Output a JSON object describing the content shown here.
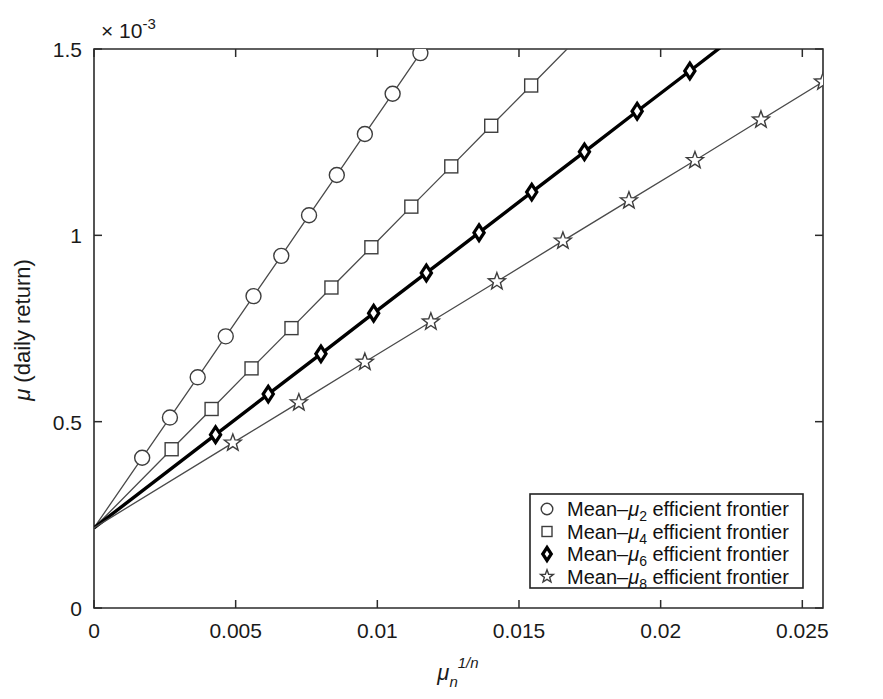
{
  "figure": {
    "background_color": "#ffffff",
    "axis_color": "#2b2b2b",
    "line_color_thin": "#4a4a4a",
    "line_color_thick": "#000000"
  },
  "chart_data": {
    "type": "line",
    "title": "",
    "subtitle": "",
    "xlabel": "μₙ^(1/n)",
    "xlabel_base": "μ",
    "xlabel_sub": "n",
    "xlabel_sup": "1/n",
    "ylabel": "μ (daily return)",
    "ylabel_base": "μ",
    "ylabel_rest": " (daily return)",
    "y_multiplier": "× 10",
    "y_multiplier_exp": "-3",
    "xlim": [
      0,
      0.02573
    ],
    "ylim": [
      0,
      1.5
    ],
    "y_scale_factor": 0.001,
    "xticks": [
      0,
      0.005,
      0.01,
      0.015,
      0.02,
      0.025
    ],
    "xticklabels": [
      "0",
      "0.005",
      "0.01",
      "0.015",
      "0.02",
      "0.025"
    ],
    "yticks": [
      0,
      0.5,
      1,
      1.5
    ],
    "yticklabels": [
      "0",
      "0.5",
      "1",
      "1.5"
    ],
    "grid": false,
    "legend_position": "lower right",
    "intercept": 0.215,
    "series": [
      {
        "name": "Mean–μ₂ efficient frontier",
        "label_prefix": "Mean–",
        "label_mu": "μ",
        "label_sub": "2",
        "label_suffix": " efficient frontier",
        "marker": "circle",
        "linewidth": "thin",
        "slope": 110.5,
        "x": [
          0,
          0.0017,
          0.00268,
          0.00366,
          0.00465,
          0.00563,
          0.00661,
          0.00759,
          0.00857,
          0.00956,
          0.01054,
          0.01152,
          0.0125
        ],
        "y": [
          0.215,
          0.403,
          0.511,
          0.619,
          0.729,
          0.837,
          0.945,
          1.054,
          1.162,
          1.272,
          1.38,
          1.489,
          1.597
        ]
      },
      {
        "name": "Mean–μ₄ efficient frontier",
        "label_prefix": "Mean–",
        "label_mu": "μ",
        "label_sub": "4",
        "label_suffix": " efficient frontier",
        "marker": "square",
        "linewidth": "thin",
        "slope": 76.9,
        "x": [
          0,
          0.00274,
          0.00415,
          0.00556,
          0.00697,
          0.00838,
          0.00979,
          0.0112,
          0.01261,
          0.01402,
          0.01543,
          0.01684,
          0.01825
        ],
        "y": [
          0.215,
          0.426,
          0.534,
          0.643,
          0.751,
          0.86,
          0.968,
          1.077,
          1.185,
          1.294,
          1.402,
          1.511,
          1.619
        ]
      },
      {
        "name": "Mean–μ₆ efficient frontier",
        "label_prefix": "Mean–",
        "label_mu": "μ",
        "label_sub": "6",
        "label_suffix": " efficient frontier",
        "marker": "diamond",
        "linewidth": "thick",
        "slope": 58.3,
        "x": [
          0,
          0.00429,
          0.00615,
          0.00801,
          0.00987,
          0.01173,
          0.01359,
          0.01545,
          0.01731,
          0.01917,
          0.02103,
          0.02289,
          0.02475
        ],
        "y": [
          0.215,
          0.465,
          0.574,
          0.682,
          0.791,
          0.899,
          1.007,
          1.116,
          1.224,
          1.333,
          1.441,
          1.55,
          1.658
        ]
      },
      {
        "name": "Mean–μ₈ efficient frontier",
        "label_prefix": "Mean–",
        "label_mu": "μ",
        "label_sub": "8",
        "label_suffix": " efficient frontier",
        "marker": "star",
        "linewidth": "thin",
        "slope": 46.5,
        "x": [
          0,
          0.0049,
          0.00723,
          0.00956,
          0.01189,
          0.01422,
          0.01655,
          0.01888,
          0.02121,
          0.02354,
          0.02573
        ],
        "y": [
          0.215,
          0.443,
          0.551,
          0.66,
          0.768,
          0.876,
          0.985,
          1.093,
          1.201,
          1.31,
          1.412
        ]
      }
    ]
  }
}
